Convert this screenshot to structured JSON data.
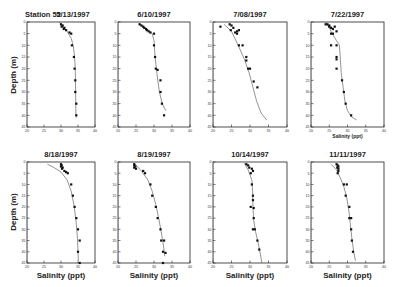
{
  "figure": {
    "station_label": "Station 52",
    "y_axis_label": "Depth (m)",
    "x_axis_label": "Salinity (ppt)"
  },
  "chart_data": [
    {
      "type": "scatter",
      "title": "5/13/1997",
      "prefix": "Station 52",
      "xlabel": "",
      "ylabel": "Depth (m)",
      "xlim": [
        20,
        40
      ],
      "ylim": [
        45,
        0
      ],
      "xticks": [
        20,
        25,
        30,
        35,
        40
      ],
      "yticks": [
        0,
        5,
        10,
        15,
        20,
        25,
        30,
        35,
        40,
        45
      ],
      "points": [
        [
          30,
          1
        ],
        [
          30.5,
          1.5
        ],
        [
          30.2,
          2
        ],
        [
          31,
          2.5
        ],
        [
          30.8,
          3
        ],
        [
          31.5,
          3.5
        ],
        [
          32.5,
          4.5
        ],
        [
          33,
          5
        ],
        [
          33.2,
          10
        ],
        [
          33.8,
          15
        ],
        [
          34,
          20
        ],
        [
          34.2,
          25
        ],
        [
          34.2,
          30
        ],
        [
          34.5,
          35
        ],
        [
          34.5,
          40
        ]
      ],
      "fit": [
        [
          29.5,
          0
        ],
        [
          30.5,
          2
        ],
        [
          31.8,
          4
        ],
        [
          33,
          7
        ],
        [
          33.6,
          10
        ],
        [
          34,
          15
        ],
        [
          34.2,
          20
        ],
        [
          34.3,
          30
        ],
        [
          34.4,
          40
        ],
        [
          34.5,
          41
        ]
      ]
    },
    {
      "type": "scatter",
      "title": "6/10/1997",
      "xlabel": "",
      "ylabel": "",
      "xlim": [
        20,
        40
      ],
      "ylim": [
        45,
        0
      ],
      "xticks": [
        20,
        25,
        30,
        35,
        40
      ],
      "yticks": [
        0,
        5,
        10,
        15,
        20,
        25,
        30,
        35,
        40,
        45
      ],
      "points": [
        [
          26,
          1
        ],
        [
          26.5,
          1.5
        ],
        [
          27,
          2
        ],
        [
          27.3,
          2.5
        ],
        [
          27.8,
          3
        ],
        [
          28,
          3.5
        ],
        [
          28.5,
          4
        ],
        [
          29,
          4.5
        ],
        [
          30,
          5
        ],
        [
          30,
          10
        ],
        [
          30.3,
          15
        ],
        [
          30.5,
          20
        ],
        [
          31,
          20.5
        ],
        [
          31.8,
          25
        ],
        [
          31.8,
          30
        ],
        [
          32.2,
          35
        ],
        [
          32.8,
          40
        ]
      ],
      "fit": [
        [
          25.8,
          0.5
        ],
        [
          27,
          2
        ],
        [
          28.5,
          3.5
        ],
        [
          29.5,
          5
        ],
        [
          30,
          8
        ],
        [
          30.3,
          15
        ],
        [
          30.8,
          22
        ],
        [
          31.5,
          30
        ],
        [
          32.3,
          35
        ],
        [
          33.3,
          38
        ]
      ]
    },
    {
      "type": "scatter",
      "title": "7/08/1997",
      "xlabel": "",
      "ylabel": "",
      "xlim": [
        20,
        40
      ],
      "ylim": [
        45,
        0
      ],
      "xticks": [
        20,
        25,
        30,
        35,
        40
      ],
      "yticks": [
        0,
        5,
        10,
        15,
        20,
        25,
        30,
        35,
        40,
        45
      ],
      "points": [
        [
          22,
          2
        ],
        [
          24.5,
          1
        ],
        [
          25,
          1.5
        ],
        [
          25.5,
          2.5
        ],
        [
          24.8,
          3.5
        ],
        [
          26,
          4.5
        ],
        [
          26.5,
          4
        ],
        [
          27,
          3.5
        ],
        [
          26.5,
          5
        ],
        [
          27,
          10
        ],
        [
          28,
          10
        ],
        [
          29,
          15
        ],
        [
          29,
          16.5
        ],
        [
          29.5,
          20
        ],
        [
          30,
          20
        ],
        [
          31,
          25.5
        ],
        [
          32,
          28
        ]
      ],
      "fit": [
        [
          23,
          1
        ],
        [
          25,
          4
        ],
        [
          26.8,
          10
        ],
        [
          28.5,
          16
        ],
        [
          29.8,
          22
        ],
        [
          30.8,
          28
        ],
        [
          31.8,
          34
        ],
        [
          33,
          39
        ],
        [
          34.5,
          42
        ]
      ]
    },
    {
      "type": "scatter",
      "title": "7/22/1997",
      "xlabel": "Salinity (ppt)",
      "ylabel": "",
      "xlim": [
        20,
        40
      ],
      "ylim": [
        45,
        0
      ],
      "xticks": [
        20,
        25,
        30,
        35,
        40
      ],
      "yticks": [
        0,
        5,
        10,
        15,
        20,
        25,
        30,
        35,
        40,
        45
      ],
      "points": [
        [
          24,
          1
        ],
        [
          24.5,
          1
        ],
        [
          25,
          1.5
        ],
        [
          25,
          2
        ],
        [
          25.5,
          2.5
        ],
        [
          26,
          3
        ],
        [
          26.5,
          2
        ],
        [
          27,
          4
        ],
        [
          25.5,
          5
        ],
        [
          26,
          5
        ],
        [
          25.5,
          10
        ],
        [
          27,
          10
        ],
        [
          27,
          15
        ],
        [
          27,
          16
        ],
        [
          27,
          20
        ],
        [
          28.5,
          25
        ],
        [
          29,
          30
        ],
        [
          29.5,
          35
        ],
        [
          31,
          40
        ]
      ],
      "fit": [
        [
          24,
          0
        ],
        [
          25,
          2.5
        ],
        [
          26,
          5.5
        ],
        [
          27,
          8
        ],
        [
          27.8,
          10
        ],
        [
          28,
          15
        ],
        [
          28.3,
          22
        ],
        [
          28.8,
          28
        ],
        [
          29.3,
          34
        ],
        [
          30,
          38
        ],
        [
          31,
          40.5
        ],
        [
          32.5,
          42
        ]
      ]
    },
    {
      "type": "scatter",
      "title": "8/18/1997",
      "xlabel": "Salinity (ppt)",
      "ylabel": "Depth (m)",
      "xlim": [
        20,
        40
      ],
      "ylim": [
        45,
        0
      ],
      "xticks": [
        20,
        25,
        30,
        35,
        40
      ],
      "yticks": [
        0,
        5,
        10,
        15,
        20,
        25,
        30,
        35,
        40,
        45
      ],
      "points": [
        [
          30,
          1
        ],
        [
          30.2,
          1.5
        ],
        [
          30,
          2
        ],
        [
          30.5,
          2.5
        ],
        [
          30.3,
          3
        ],
        [
          31,
          4
        ],
        [
          31.5,
          4.5
        ],
        [
          32,
          5
        ],
        [
          33,
          10
        ],
        [
          33.5,
          15
        ],
        [
          34,
          20
        ],
        [
          34.5,
          25
        ],
        [
          35,
          30
        ],
        [
          35.5,
          35
        ],
        [
          35,
          40
        ],
        [
          35.5,
          45
        ]
      ],
      "fit": [
        [
          26,
          1
        ],
        [
          28,
          2.5
        ],
        [
          30,
          4.5
        ],
        [
          31.8,
          8
        ],
        [
          33,
          13
        ],
        [
          33.8,
          19
        ],
        [
          34.4,
          26
        ],
        [
          34.8,
          33
        ],
        [
          35,
          40
        ],
        [
          35.1,
          44
        ]
      ]
    },
    {
      "type": "scatter",
      "title": "8/19/1997",
      "xlabel": "Salinity (ppt)",
      "ylabel": "",
      "xlim": [
        20,
        40
      ],
      "ylim": [
        45,
        0
      ],
      "xticks": [
        20,
        25,
        30,
        35,
        40
      ],
      "yticks": [
        0,
        5,
        10,
        15,
        20,
        25,
        30,
        35,
        40,
        45
      ],
      "points": [
        [
          24.5,
          1
        ],
        [
          24.5,
          1.5
        ],
        [
          24.8,
          2
        ],
        [
          24.5,
          2.5
        ],
        [
          25,
          3
        ],
        [
          27,
          4
        ],
        [
          27.5,
          5
        ],
        [
          29,
          10
        ],
        [
          29.5,
          15
        ],
        [
          30.5,
          20
        ],
        [
          31,
          25
        ],
        [
          31.8,
          30
        ],
        [
          32,
          35
        ],
        [
          32.8,
          35
        ],
        [
          32.5,
          40
        ],
        [
          33.2,
          40.5
        ],
        [
          32.5,
          45
        ]
      ],
      "fit": [
        [
          24.5,
          0.5
        ],
        [
          26.5,
          4
        ],
        [
          28.3,
          8
        ],
        [
          29.5,
          13
        ],
        [
          30.5,
          19
        ],
        [
          31.3,
          25
        ],
        [
          32,
          31
        ],
        [
          32.6,
          37
        ],
        [
          33,
          42
        ]
      ]
    },
    {
      "type": "scatter",
      "title": "10/14/1997",
      "xlabel": "Salinity (ppt)",
      "ylabel": "",
      "xlim": [
        20,
        40
      ],
      "ylim": [
        45,
        0
      ],
      "xticks": [
        20,
        25,
        30,
        35,
        40
      ],
      "yticks": [
        0,
        5,
        10,
        15,
        20,
        25,
        30,
        35,
        40,
        45
      ],
      "points": [
        [
          29,
          1
        ],
        [
          29.5,
          1.5
        ],
        [
          29.8,
          2.5
        ],
        [
          30.5,
          3
        ],
        [
          30.8,
          4
        ],
        [
          30.2,
          5
        ],
        [
          30.5,
          10
        ],
        [
          30.8,
          15
        ],
        [
          30.8,
          17
        ],
        [
          30.2,
          20
        ],
        [
          31,
          20.5
        ],
        [
          31,
          25
        ],
        [
          30.8,
          30
        ],
        [
          31.3,
          30
        ],
        [
          32,
          35
        ],
        [
          32.5,
          39
        ]
      ],
      "fit": [
        [
          28.5,
          0.5
        ],
        [
          29.5,
          3.5
        ],
        [
          30.5,
          8
        ],
        [
          30.7,
          13
        ],
        [
          30.8,
          20
        ],
        [
          31,
          26
        ],
        [
          31.5,
          31
        ],
        [
          32.2,
          36
        ],
        [
          32.8,
          41
        ],
        [
          33.2,
          45
        ]
      ]
    },
    {
      "type": "scatter",
      "title": "11/11/1997",
      "xlabel": "Salinity (ppt)",
      "ylabel": "",
      "xlim": [
        20,
        40
      ],
      "ylim": [
        45,
        0
      ],
      "xticks": [
        20,
        25,
        30,
        35,
        40
      ],
      "yticks": [
        0,
        5,
        10,
        15,
        20,
        25,
        30,
        35,
        40,
        45
      ],
      "points": [
        [
          27,
          1
        ],
        [
          27.3,
          1.5
        ],
        [
          27.5,
          2
        ],
        [
          27.2,
          2.5
        ],
        [
          27.5,
          3
        ],
        [
          27.5,
          4
        ],
        [
          27.3,
          5
        ],
        [
          29,
          10
        ],
        [
          29.8,
          10
        ],
        [
          29.5,
          15
        ],
        [
          30.5,
          20
        ],
        [
          30.5,
          25
        ],
        [
          31,
          25
        ],
        [
          31,
          30
        ],
        [
          31.2,
          35
        ],
        [
          31.5,
          40
        ]
      ],
      "fit": [
        [
          25.5,
          1
        ],
        [
          27,
          3.5
        ],
        [
          28,
          7
        ],
        [
          29,
          11
        ],
        [
          29.8,
          16
        ],
        [
          30.4,
          22
        ],
        [
          30.8,
          28
        ],
        [
          31.2,
          34
        ],
        [
          31.7,
          40
        ],
        [
          32.2,
          44
        ]
      ]
    }
  ]
}
